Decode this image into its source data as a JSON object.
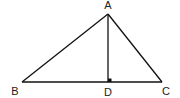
{
  "diagram": {
    "type": "triangle-with-altitude",
    "stroke_color": "#111111",
    "points": {
      "A": {
        "label": "A",
        "x": 108,
        "y": 14
      },
      "B": {
        "label": "B",
        "x": 22,
        "y": 82
      },
      "C": {
        "label": "C",
        "x": 162,
        "y": 82
      },
      "D": {
        "label": "D",
        "x": 108,
        "y": 82
      }
    },
    "segments": [
      "AB",
      "AC",
      "BC",
      "AD"
    ],
    "right_angle_at": "D",
    "labels": {
      "A": "A",
      "B": "B",
      "C": "C",
      "D": "D"
    }
  }
}
